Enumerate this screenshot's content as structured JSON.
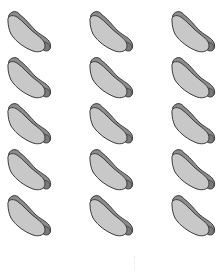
{
  "image": {
    "description": "Grid of hot dog clip-art icons",
    "layout": {
      "columns": 3,
      "rows": 5
    },
    "icon": "hotdog-icon",
    "colors": {
      "background": "#ffffff",
      "bun": "#8c8c8c",
      "sausage": "#c8c8c8",
      "outline": "#3a3a3a"
    },
    "items": [
      {
        "row": 0,
        "col": 0
      },
      {
        "row": 0,
        "col": 1
      },
      {
        "row": 0,
        "col": 2
      },
      {
        "row": 1,
        "col": 0
      },
      {
        "row": 1,
        "col": 1
      },
      {
        "row": 1,
        "col": 2
      },
      {
        "row": 2,
        "col": 0
      },
      {
        "row": 2,
        "col": 1
      },
      {
        "row": 2,
        "col": 2
      },
      {
        "row": 3,
        "col": 0
      },
      {
        "row": 3,
        "col": 1
      },
      {
        "row": 3,
        "col": 2
      },
      {
        "row": 4,
        "col": 0
      },
      {
        "row": 4,
        "col": 1
      },
      {
        "row": 4,
        "col": 2
      }
    ]
  }
}
